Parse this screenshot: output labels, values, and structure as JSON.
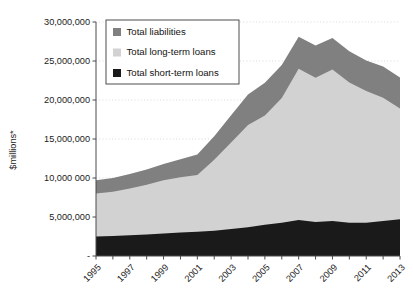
{
  "chart_data": {
    "type": "area",
    "stacked": true,
    "title": "",
    "subtitle": "",
    "xlabel": "",
    "ylabel": "$millions*",
    "ylim": [
      0,
      30000000
    ],
    "xlim": [
      1995,
      2013
    ],
    "grid": true,
    "legend_position": "top-left",
    "ytick_labels": [
      "30,000,000",
      "25,000,000",
      "20,000,000",
      "15,000,000",
      "10,000 000",
      "5,000,000",
      "-"
    ],
    "ytick_values": [
      30000000,
      25000000,
      20000000,
      15000000,
      10000000,
      5000000,
      0
    ],
    "xtick_labels": [
      "1995",
      "1997",
      "1999",
      "2001",
      "2003",
      "2005",
      "2007",
      "2009",
      "2011",
      "2013"
    ],
    "xtick_values": [
      1995,
      1997,
      1999,
      2001,
      2003,
      2005,
      2007,
      2009,
      2011,
      2013
    ],
    "x": [
      1995,
      1996,
      1997,
      1998,
      1999,
      2000,
      2001,
      2002,
      2003,
      2004,
      2005,
      2006,
      2007,
      2008,
      2009,
      2010,
      2011,
      2012,
      2013
    ],
    "series": [
      {
        "name": "Total short-term loans",
        "color": "#1a1a1a",
        "stack_order": 1,
        "values": [
          2500000,
          2550000,
          2650000,
          2750000,
          2900000,
          3000000,
          3100000,
          3250000,
          3450000,
          3700000,
          4000000,
          4250000,
          4600000,
          4350000,
          4500000,
          4250000,
          4250000,
          4500000,
          4700000
        ]
      },
      {
        "name": "Total long-term loans",
        "color": "#d2d2d2",
        "stack_order": 2,
        "values": [
          5500000,
          5700000,
          6000000,
          6400000,
          6800000,
          7100000,
          7300000,
          9100000,
          11100000,
          13100000,
          14000000,
          16000000,
          19400000,
          18500000,
          19400000,
          18000000,
          16900000,
          15800000,
          14200000
        ]
      },
      {
        "name": "Total liabilities",
        "color": "#808080",
        "stack_order": 3,
        "values": [
          1700000,
          1750000,
          1850000,
          1950000,
          2100000,
          2300000,
          2600000,
          3000000,
          3500000,
          3900000,
          4200000,
          4250000,
          4100000,
          4150000,
          4050000,
          4000000,
          3900000,
          4000000,
          4000000
        ]
      }
    ],
    "stack_totals": [
      9700000,
      10000000,
      10500000,
      11100000,
      11800000,
      12400000,
      13000000,
      15350000,
      18050000,
      20700000,
      22200000,
      24500000,
      28100000,
      27000000,
      27950000,
      26250000,
      25050000,
      24300000,
      22900000
    ]
  },
  "legend": {
    "entries": [
      {
        "label": "Total liabilities",
        "color": "#808080",
        "swatch": "legend-swatch-liabilities"
      },
      {
        "label": "Total long-term loans",
        "color": "#d2d2d2",
        "swatch": "legend-swatch-longterm"
      },
      {
        "label": "Total short-term loans",
        "color": "#1a1a1a",
        "swatch": "legend-swatch-shortterm"
      }
    ]
  },
  "axes": {
    "y_title": "$millions*"
  },
  "colors": {
    "liabilities": "#808080",
    "long_term": "#d2d2d2",
    "short_term": "#1a1a1a",
    "axis": "#4a4a4a",
    "grid": "#c9c9c9",
    "text": "#1b1b1b",
    "background": "#ffffff"
  }
}
